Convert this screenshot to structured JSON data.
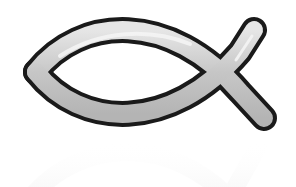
{
  "image": {
    "subject": "ichthys-fish-symbol",
    "has_reflection": true,
    "colors": {
      "background": "#ffffff",
      "outline": "#1a1a1a",
      "fill": "#c8c8c8",
      "highlight": "#f2f2f2",
      "reflection": "#d8d8d8"
    }
  }
}
